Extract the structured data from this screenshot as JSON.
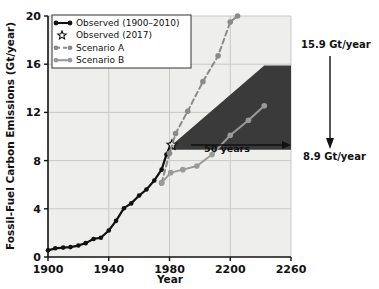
{
  "chart_data": {
    "type": "line",
    "title": "",
    "xlabel": "Year",
    "ylabel": "Fossil-Fuel Carbon Emissions (Gt/year)",
    "xticklabels": [
      "1900",
      "1940",
      "1980",
      "2200",
      "2260"
    ],
    "xtickpos": [
      0,
      1,
      2,
      3,
      4
    ],
    "yticklabels": [
      "0",
      "4",
      "8",
      "12",
      "16",
      "20"
    ],
    "ylim": [
      0,
      20
    ],
    "grid": true,
    "legend_position": "upper-left",
    "series": [
      {
        "name": "Observed (1900–2010)",
        "style": "solid",
        "color": "#111111",
        "marker": "filled-circle",
        "points": [
          [
            0.0,
            0.55
          ],
          [
            0.12,
            0.72
          ],
          [
            0.25,
            0.78
          ],
          [
            0.37,
            0.82
          ],
          [
            0.5,
            0.95
          ],
          [
            0.62,
            1.15
          ],
          [
            0.75,
            1.5
          ],
          [
            0.87,
            1.6
          ],
          [
            1.0,
            2.2
          ],
          [
            1.12,
            3.0
          ],
          [
            1.25,
            4.05
          ],
          [
            1.37,
            4.45
          ],
          [
            1.5,
            5.1
          ],
          [
            1.62,
            5.6
          ],
          [
            1.75,
            6.35
          ],
          [
            1.87,
            7.25
          ],
          [
            1.95,
            8.5
          ],
          [
            2.02,
            9.35
          ]
        ]
      },
      {
        "name": "Observed (2017)",
        "style": "marker-only",
        "color": "#111111",
        "marker": "open-star",
        "points": [
          [
            2.04,
            9.3
          ]
        ]
      },
      {
        "name": "Scenario A",
        "style": "dashed",
        "color": "#8a8a8a",
        "marker": "filled-circle",
        "points": [
          [
            1.87,
            6.15
          ],
          [
            2.0,
            8.6
          ],
          [
            2.1,
            10.25
          ],
          [
            2.3,
            12.1
          ],
          [
            2.55,
            14.55
          ],
          [
            2.8,
            16.7
          ],
          [
            3.0,
            19.5
          ],
          [
            3.12,
            20.0
          ]
        ]
      },
      {
        "name": "Scenario B",
        "style": "solid",
        "color": "#9a9a9a",
        "marker": "filled-circle",
        "points": [
          [
            1.87,
            6.15
          ],
          [
            2.02,
            7.0
          ],
          [
            2.22,
            7.25
          ],
          [
            2.45,
            7.55
          ],
          [
            2.7,
            8.5
          ],
          [
            3.0,
            10.1
          ],
          [
            3.3,
            11.35
          ],
          [
            3.56,
            12.55
          ]
        ]
      }
    ],
    "wedge": {
      "label": "dark-shaded-avoided-emissions-wedge",
      "color": "#3a3a3a",
      "apex": [
        2.04,
        9.3
      ],
      "upper_end": [
        3.56,
        15.9
      ],
      "lower_end": [
        3.56,
        8.9
      ]
    },
    "annotations": [
      {
        "name": "span-label",
        "text": "50 years"
      },
      {
        "name": "upper-value",
        "text": "15.9 Gt/year"
      },
      {
        "name": "lower-value",
        "text": "8.9 Gt/year"
      }
    ]
  },
  "legend": {
    "items": [
      {
        "label": "Observed (1900–2010)",
        "marker": "line-with-dots",
        "color": "#111111"
      },
      {
        "label": "Observed (2017)",
        "marker": "open-star",
        "color": "#111111"
      },
      {
        "label": "Scenario A",
        "marker": "dashed-line-with-dots",
        "color": "#8a8a8a"
      },
      {
        "label": "Scenario B",
        "marker": "solid-line-with-dots",
        "color": "#9a9a9a"
      }
    ]
  },
  "axes": {
    "ylabel": "Fossil-Fuel Carbon Emissions (Gt/year)",
    "xlabel": "Year",
    "yticks": [
      "0",
      "4",
      "8",
      "12",
      "16",
      "20"
    ],
    "xticks": [
      "1900",
      "1940",
      "1980",
      "2200",
      "2260"
    ]
  },
  "annotations": {
    "span": "50 years",
    "upper": "15.9 Gt/year",
    "lower": "8.9 Gt/year"
  },
  "colors": {
    "plot_background": "#eeeeec",
    "grid": "#c8c8c4",
    "observed": "#111111",
    "scenario_a": "#8a8a8a",
    "scenario_b": "#9a9a9a",
    "wedge": "#3a3a3a"
  }
}
